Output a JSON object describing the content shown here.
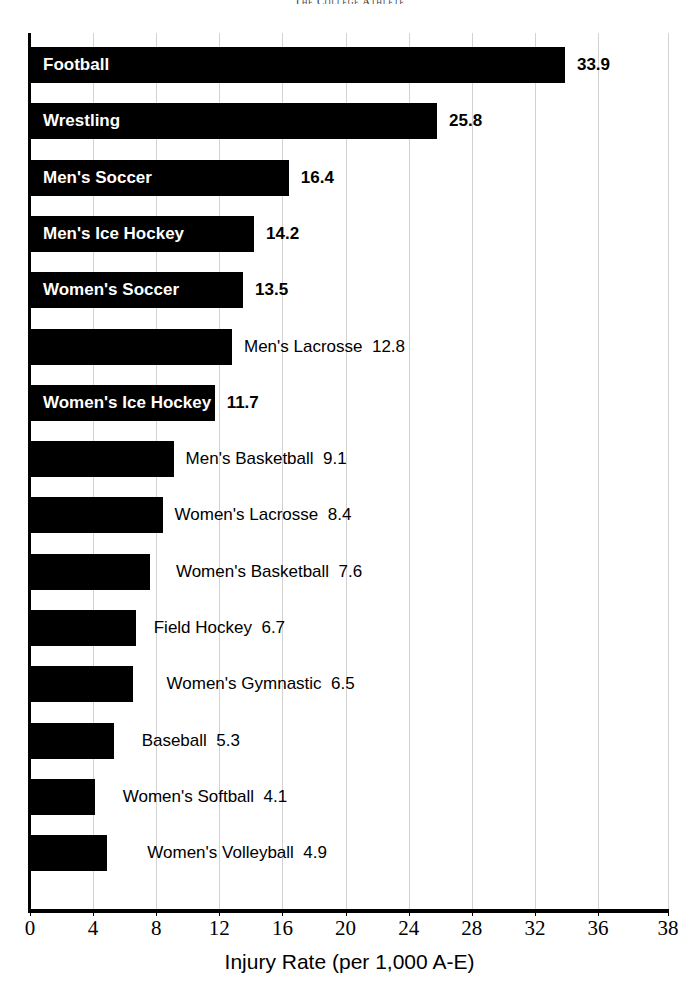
{
  "running_head": "The College Athlete",
  "chart_data": {
    "type": "bar",
    "orientation": "horizontal",
    "title": "",
    "subtitle": "",
    "xlabel": "Injury Rate (per 1,000 A-E)",
    "ylabel": "",
    "xlim": [
      0,
      38
    ],
    "ylim": null,
    "grid": "vertical gridlines at each x tick",
    "legend": "none",
    "bar_color": "#000000",
    "background_color": "#ffffff",
    "gridline_color": "#d2d2d2",
    "axis_color": "#000000",
    "xticks": [
      0,
      4,
      8,
      12,
      16,
      20,
      24,
      28,
      32,
      36,
      38
    ],
    "xtick_labels": [
      "0",
      "4",
      "8",
      "12",
      "16",
      "20",
      "24",
      "28",
      "32",
      "36",
      "38"
    ],
    "categories": [
      "Football",
      "Wrestling",
      "Men's Soccer",
      "Men's Ice Hockey",
      "Women's Soccer",
      "Men's Lacrosse",
      "Women's Ice Hockey",
      "Men's Basketball",
      "Women's Lacrosse",
      "Women's Basketball",
      "Field Hockey",
      "Women's Gymnastic",
      "Baseball",
      "Women's Softball",
      "Women's Volleyball"
    ],
    "values": [
      33.9,
      25.8,
      16.4,
      14.2,
      13.5,
      12.8,
      11.7,
      9.1,
      8.4,
      7.6,
      6.7,
      6.5,
      5.3,
      4.1,
      4.9
    ],
    "value_labels": [
      "33.9",
      "25.8",
      "16.4",
      "14.2",
      "13.5",
      "12.8",
      "11.7",
      "9.1",
      "8.4",
      "7.6",
      "6.7",
      "6.5",
      "5.3",
      "4.1",
      "4.9"
    ]
  },
  "bars": [
    {
      "label": "Football",
      "value": "33.9",
      "label_placement": "inside",
      "label_offset": 0,
      "value_offset": 0
    },
    {
      "label": "Wrestling",
      "value": "25.8",
      "label_placement": "inside",
      "label_offset": 0,
      "value_offset": 0
    },
    {
      "label": "Men's Soccer",
      "value": "16.4",
      "label_placement": "inside",
      "label_offset": 0,
      "value_offset": 0
    },
    {
      "label": "Men's Ice Hockey",
      "value": "14.2",
      "label_placement": "inside",
      "label_offset": 0,
      "value_offset": 0
    },
    {
      "label": "Women's Soccer",
      "value": "13.5",
      "label_placement": "inside",
      "label_offset": 0,
      "value_offset": 0
    },
    {
      "label": "Men's Lacrosse",
      "value": "12.8",
      "label_placement": "outside",
      "label_offset": 0,
      "value_offset": 0
    },
    {
      "label": "Women's Ice Hockey",
      "value": "11.7",
      "label_placement": "inside",
      "label_offset": 0,
      "value_offset": 0
    },
    {
      "label": "Men's Basketball",
      "value": "9.1",
      "label_placement": "outside",
      "label_offset": 0,
      "value_offset": 0
    },
    {
      "label": "Women's Lacrosse",
      "value": "8.4",
      "label_placement": "outside",
      "label_offset": 0,
      "value_offset": 0
    },
    {
      "label": "Women's Basketball",
      "value": "7.6",
      "label_placement": "outside",
      "label_offset": 14,
      "value_offset": 0
    },
    {
      "label": "Field Hockey",
      "value": "6.7",
      "label_placement": "outside",
      "label_offset": 6,
      "value_offset": 0
    },
    {
      "label": "Women's Gymnastic",
      "value": "6.5",
      "label_placement": "outside",
      "label_offset": 22,
      "value_offset": 0
    },
    {
      "label": "Baseball",
      "value": "5.3",
      "label_placement": "outside",
      "label_offset": 16,
      "value_offset": 0
    },
    {
      "label": "Women's Softball",
      "value": "4.1",
      "label_placement": "outside",
      "label_offset": 16,
      "value_offset": 0
    },
    {
      "label": "Women's Volleyball",
      "value": "4.9",
      "label_placement": "outside",
      "label_offset": 28,
      "value_offset": 0
    }
  ]
}
